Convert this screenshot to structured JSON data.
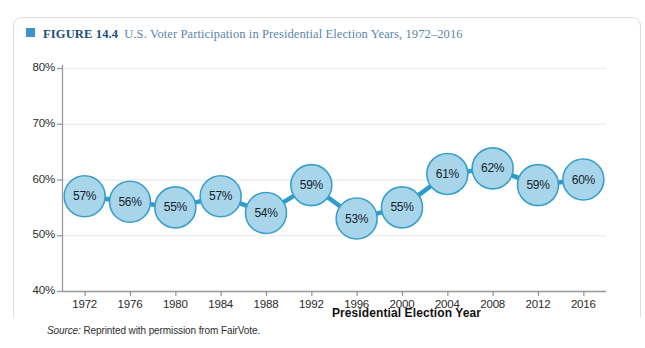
{
  "caption": {
    "bullet": "square-bullet",
    "figure_number": "FIGURE 14.4",
    "title": "U.S. Voter Participation in Presidential Election Years, 1972–2016"
  },
  "source": {
    "label": "Source:",
    "text": "Reprinted with permission from FairVote."
  },
  "colors": {
    "bullet": "#3a93c9",
    "figure_number": "#1b4f7e",
    "caption_text": "#5a86a8",
    "bubble_fill": "#a8d5ea",
    "bubble_stroke": "#3a9fc9",
    "connector": "#2e9bcb",
    "gridline": "#eceef0",
    "axis": "#9a9a9a",
    "frame": "#d9dde0"
  },
  "chart_data": {
    "type": "line",
    "title": "U.S. Voter Participation in Presidential Election Years, 1972–2016",
    "xlabel": "Presidential Election Year",
    "ylabel": "",
    "ylim": [
      40,
      80
    ],
    "ytick_labels": [
      "80%",
      "70%",
      "60%",
      "50%",
      "40%"
    ],
    "ytick_values": [
      80,
      70,
      60,
      50,
      40
    ],
    "grid": true,
    "legend": "none",
    "marker": "bubble-with-value-label",
    "categories": [
      "1972",
      "1976",
      "1980",
      "1984",
      "1988",
      "1992",
      "1996",
      "2000",
      "2004",
      "2008",
      "2012",
      "2016"
    ],
    "values": [
      57,
      56,
      55,
      57,
      54,
      59,
      53,
      55,
      61,
      62,
      59,
      60
    ],
    "point_labels": [
      "57%",
      "56%",
      "55%",
      "57%",
      "54%",
      "59%",
      "53%",
      "55%",
      "61%",
      "62%",
      "59%",
      "60%"
    ]
  }
}
